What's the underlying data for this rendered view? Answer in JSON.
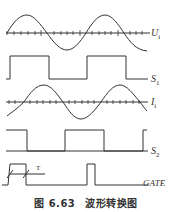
{
  "figure": {
    "caption_number": "图 6.63",
    "caption_title": "波形转换图"
  },
  "signals": [
    {
      "id": "Ui",
      "label_main": "U",
      "label_sub": "i",
      "type": "sine"
    },
    {
      "id": "S1",
      "label_main": "S",
      "label_sub": "1",
      "type": "square"
    },
    {
      "id": "Ii",
      "label_main": "I",
      "label_sub": "i",
      "type": "sine-phase-shifted"
    },
    {
      "id": "S2",
      "label_main": "S",
      "label_sub": "2",
      "type": "square"
    },
    {
      "id": "GATE",
      "label_main": "GATE",
      "label_sub": "",
      "type": "pulse"
    }
  ],
  "annotations": {
    "period_marker": "T"
  },
  "colors": {
    "line": "#333333",
    "background": "#ffffff"
  }
}
